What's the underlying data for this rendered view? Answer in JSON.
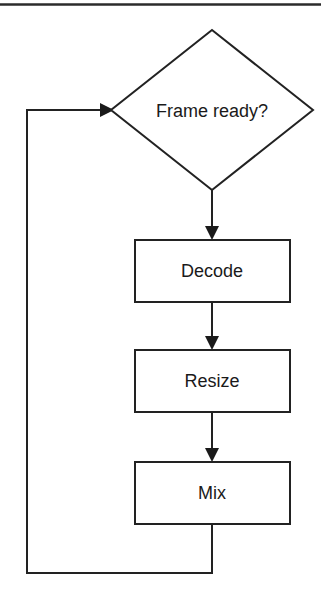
{
  "figure": {
    "type": "flowchart",
    "top_rule": {
      "present": true,
      "y": 4,
      "x_start": 0,
      "x_end": 321,
      "color": "#2b2b2b"
    },
    "colors": {
      "stroke": "#222222",
      "fill": "#ffffff",
      "text": "#1a1a1a",
      "background": "#ffffff"
    },
    "nodes": [
      {
        "id": "frame-ready",
        "shape": "diamond",
        "label": "Frame ready?",
        "cx": 212,
        "cy": 110,
        "half_width": 101,
        "half_height": 80
      },
      {
        "id": "decode",
        "shape": "rectangle",
        "label": "Decode",
        "x": 135,
        "y": 240,
        "width": 155,
        "height": 62
      },
      {
        "id": "resize",
        "shape": "rectangle",
        "label": "Resize",
        "x": 135,
        "y": 350,
        "width": 155,
        "height": 62
      },
      {
        "id": "mix",
        "shape": "rectangle",
        "label": "Mix",
        "x": 135,
        "y": 462,
        "width": 155,
        "height": 62
      }
    ],
    "edges": [
      {
        "id": "frame-ready-to-decode",
        "from": "frame-ready",
        "to": "decode",
        "label": "",
        "arrow": true
      },
      {
        "id": "decode-to-resize",
        "from": "decode",
        "to": "resize",
        "label": "",
        "arrow": true
      },
      {
        "id": "resize-to-mix",
        "from": "resize",
        "to": "mix",
        "label": "",
        "arrow": true
      },
      {
        "id": "mix-to-frame-ready",
        "from": "mix",
        "to": "frame-ready",
        "label": "",
        "arrow": true,
        "routing": "feedback-loop-left"
      }
    ]
  }
}
